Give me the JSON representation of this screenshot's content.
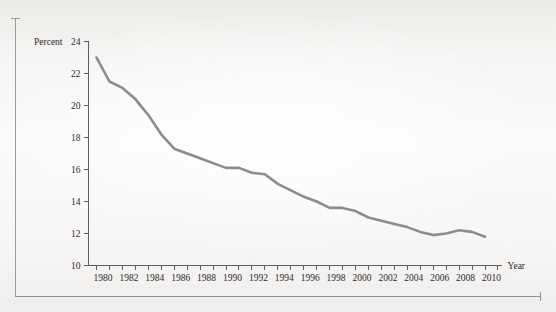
{
  "chart_data": {
    "type": "line",
    "title": "",
    "xlabel": "Year",
    "ylabel": "Percent",
    "xlim": [
      1979.4,
      2011.6
    ],
    "ylim": [
      10,
      24
    ],
    "grid": false,
    "legend": null,
    "line_color": "#8c8c8c",
    "axis_color": "#5d5d5d",
    "x_tick_step": 1,
    "x_label_step": 2,
    "y_ticks": [
      10,
      12,
      14,
      16,
      18,
      20,
      22,
      24
    ],
    "y_tick_labels": [
      "10",
      "12",
      "14",
      "16",
      "18",
      "20",
      "22",
      "24"
    ],
    "x_ticks": [
      1980,
      1981,
      1982,
      1983,
      1984,
      1985,
      1986,
      1987,
      1988,
      1989,
      1990,
      1991,
      1992,
      1993,
      1994,
      1995,
      1996,
      1997,
      1998,
      1999,
      2000,
      2001,
      2002,
      2003,
      2004,
      2005,
      2006,
      2007,
      2008,
      2009,
      2010,
      2011
    ],
    "x_tick_labels": [
      "1980",
      "",
      "1982",
      "",
      "1984",
      "",
      "1986",
      "",
      "1988",
      "",
      "1990",
      "",
      "1992",
      "",
      "1994",
      "",
      "1996",
      "",
      "1998",
      "",
      "2000",
      "",
      "2002",
      "",
      "2004",
      "",
      "2006",
      "",
      "2008",
      "",
      "2010",
      ""
    ],
    "x": [
      1980,
      1981,
      1982,
      1983,
      1984,
      1985,
      1986,
      1987,
      1988,
      1989,
      1990,
      1991,
      1992,
      1993,
      1994,
      1995,
      1996,
      1997,
      1998,
      1999,
      2000,
      2001,
      2002,
      2003,
      2004,
      2005,
      2006,
      2007,
      2008,
      2009,
      2010
    ],
    "values": [
      23.0,
      21.5,
      21.1,
      20.4,
      19.4,
      18.2,
      17.3,
      17.0,
      16.7,
      16.4,
      16.1,
      16.1,
      15.8,
      15.7,
      15.1,
      14.7,
      14.3,
      14.0,
      13.6,
      13.6,
      13.4,
      13.0,
      12.8,
      12.6,
      12.4,
      12.1,
      11.9,
      12.0,
      12.2,
      12.1,
      11.8
    ],
    "series_name": "Percent"
  },
  "axis": {
    "y_title": "Percent",
    "x_title": "Year"
  }
}
